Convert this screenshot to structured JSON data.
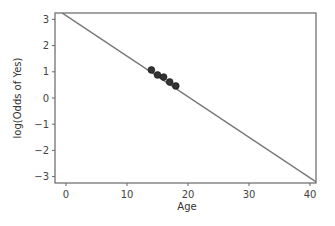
{
  "chart_data": {
    "type": "scatter",
    "title": "",
    "xlabel": "Age",
    "ylabel": "log(Odds of Yes)",
    "xlim": [
      -1.8,
      41.0
    ],
    "ylim": [
      -3.25,
      3.25
    ],
    "xticks": [
      0,
      10,
      20,
      30,
      40
    ],
    "yticks": [
      -3,
      -2,
      -1,
      0,
      1,
      2,
      3
    ],
    "grid": false,
    "legend": null,
    "series": [
      {
        "name": "observed",
        "type": "scatter",
        "x": [
          14,
          15,
          16,
          17,
          18
        ],
        "y": [
          1.07,
          0.88,
          0.8,
          0.61,
          0.46
        ],
        "color": "#333333"
      },
      {
        "name": "fitted line",
        "type": "line",
        "intercept": 3.15,
        "slope": -0.155,
        "x": [
          -0.6,
          41.0
        ],
        "y": [
          3.24,
          -3.2
        ],
        "color": "#777777"
      }
    ]
  }
}
